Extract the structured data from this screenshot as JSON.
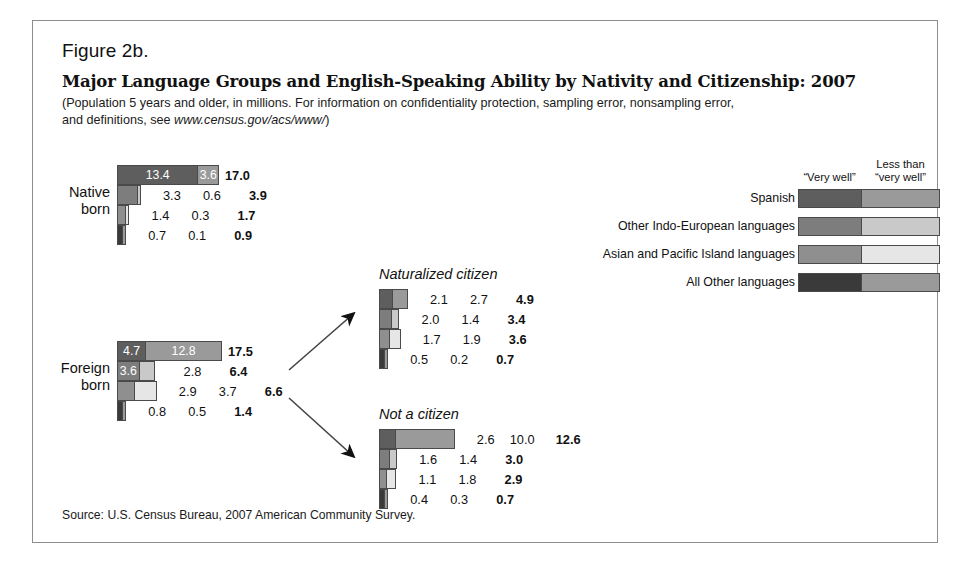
{
  "figure": {
    "number": "Figure 2b.",
    "title": "Major Language Groups and English-Speaking Ability by Nativity and Citizenship: 2007",
    "subtitle_line1": "(Population 5 years and older, in millions. For information on confidentiality protection, sampling error, nonsampling error,",
    "subtitle_line2_pre": "and definitions, see ",
    "subtitle_url": "www.census.gov/acs/www/",
    "subtitle_line2_post": ")",
    "source": "Source: U.S. Census Bureau, 2007 American Community Survey."
  },
  "legend": {
    "header_left": "“Very well”",
    "header_right_line1": "Less than",
    "header_right_line2": "“very well”",
    "items": [
      {
        "label": "Spanish",
        "color_very_well": "#5e5e5e",
        "color_less_than": "#9a9a9a"
      },
      {
        "label": "Other Indo-European languages",
        "color_very_well": "#7d7d7d",
        "color_less_than": "#c9c9c9"
      },
      {
        "label": "Asian and Pacific Island languages",
        "color_very_well": "#8f8f8f",
        "color_less_than": "#e6e6e6"
      },
      {
        "label": "All Other languages",
        "color_very_well": "#3a3a3a",
        "color_less_than": "#9a9a9a"
      }
    ]
  },
  "chart_data": {
    "type": "bar",
    "orientation": "horizontal-stacked",
    "title": "Major Language Groups and English-Speaking Ability by Nativity and Citizenship: 2007",
    "unit": "millions of people 5 years and older",
    "series": [
      {
        "name": "“Very well”",
        "color": "series-dark"
      },
      {
        "name": "Less than “very well”",
        "color": "series-light"
      }
    ],
    "categories": [
      "Spanish",
      "Other Indo-European languages",
      "Asian and Pacific Island languages",
      "All Other languages"
    ],
    "px_per_million": 6.0,
    "groups": [
      {
        "key": "native-born",
        "label_line1": "Native",
        "label_line2": "born",
        "title": "",
        "rows": [
          {
            "category": "Spanish",
            "very_well": "13.4",
            "less_than": "3.6",
            "total": "17.0",
            "very_well_v": 13.4,
            "less_than_v": 3.6,
            "total_v": 17.0,
            "inside": true
          },
          {
            "category": "Other Indo-European languages",
            "very_well": "3.3",
            "less_than": "0.6",
            "total": "3.9",
            "very_well_v": 3.3,
            "less_than_v": 0.6,
            "total_v": 3.9,
            "inside": false
          },
          {
            "category": "Asian and Pacific Island languages",
            "very_well": "1.4",
            "less_than": "0.3",
            "total": "1.7",
            "very_well_v": 1.4,
            "less_than_v": 0.3,
            "total_v": 1.7,
            "inside": false
          },
          {
            "category": "All Other languages",
            "very_well": "0.7",
            "less_than": "0.1",
            "total": "0.9",
            "very_well_v": 0.7,
            "less_than_v": 0.1,
            "total_v": 0.9,
            "inside": false
          }
        ]
      },
      {
        "key": "foreign-born",
        "label_line1": "Foreign",
        "label_line2": "born",
        "title": "",
        "rows": [
          {
            "category": "Spanish",
            "very_well": "4.7",
            "less_than": "12.8",
            "total": "17.5",
            "very_well_v": 4.7,
            "less_than_v": 12.8,
            "total_v": 17.5,
            "inside": true
          },
          {
            "category": "Other Indo-European languages",
            "very_well": "3.6",
            "less_than": "2.8",
            "total": "6.4",
            "very_well_v": 3.6,
            "less_than_v": 2.8,
            "total_v": 6.4,
            "inside": "first"
          },
          {
            "category": "Asian and Pacific Island languages",
            "very_well": "2.9",
            "less_than": "3.7",
            "total": "6.6",
            "very_well_v": 2.9,
            "less_than_v": 3.7,
            "total_v": 6.6,
            "inside": false
          },
          {
            "category": "All Other languages",
            "very_well": "0.8",
            "less_than": "0.5",
            "total": "1.4",
            "very_well_v": 0.8,
            "less_than_v": 0.5,
            "total_v": 1.4,
            "inside": false
          }
        ]
      },
      {
        "key": "naturalized-citizen",
        "label_line1": "",
        "label_line2": "",
        "title": "Naturalized citizen",
        "rows": [
          {
            "category": "Spanish",
            "very_well": "2.1",
            "less_than": "2.7",
            "total": "4.9",
            "very_well_v": 2.1,
            "less_than_v": 2.7,
            "total_v": 4.9,
            "inside": false
          },
          {
            "category": "Other Indo-European languages",
            "very_well": "2.0",
            "less_than": "1.4",
            "total": "3.4",
            "very_well_v": 2.0,
            "less_than_v": 1.4,
            "total_v": 3.4,
            "inside": false
          },
          {
            "category": "Asian and Pacific Island languages",
            "very_well": "1.7",
            "less_than": "1.9",
            "total": "3.6",
            "very_well_v": 1.7,
            "less_than_v": 1.9,
            "total_v": 3.6,
            "inside": false
          },
          {
            "category": "All Other languages",
            "very_well": "0.5",
            "less_than": "0.2",
            "total": "0.7",
            "very_well_v": 0.5,
            "less_than_v": 0.2,
            "total_v": 0.7,
            "inside": false
          }
        ]
      },
      {
        "key": "not-a-citizen",
        "label_line1": "",
        "label_line2": "",
        "title": "Not a citizen",
        "rows": [
          {
            "category": "Spanish",
            "very_well": "2.6",
            "less_than": "10.0",
            "total": "12.6",
            "very_well_v": 2.6,
            "less_than_v": 10.0,
            "total_v": 12.6,
            "inside": false
          },
          {
            "category": "Other Indo-European languages",
            "very_well": "1.6",
            "less_than": "1.4",
            "total": "3.0",
            "very_well_v": 1.6,
            "less_than_v": 1.4,
            "total_v": 3.0,
            "inside": false
          },
          {
            "category": "Asian and Pacific Island languages",
            "very_well": "1.1",
            "less_than": "1.8",
            "total": "2.9",
            "very_well_v": 1.1,
            "less_than_v": 1.8,
            "total_v": 2.9,
            "inside": false
          },
          {
            "category": "All Other languages",
            "very_well": "0.4",
            "less_than": "0.3",
            "total": "0.7",
            "very_well_v": 0.4,
            "less_than_v": 0.3,
            "total_v": 0.7,
            "inside": false
          }
        ]
      }
    ]
  },
  "layout": {
    "blocks": [
      {
        "key": "native-born",
        "left": 117,
        "top": 165,
        "label_left": 55,
        "label_top": 184,
        "title_left": 0,
        "title_top": 0
      },
      {
        "key": "foreign-born",
        "left": 117,
        "top": 341,
        "label_left": 55,
        "label_top": 360,
        "title_left": 0,
        "title_top": 0
      },
      {
        "key": "naturalized-citizen",
        "left": 379,
        "top": 289,
        "label_left": 0,
        "label_top": 0,
        "title_left": 379,
        "title_top": 266
      },
      {
        "key": "not-a-citizen",
        "left": 379,
        "top": 429,
        "label_left": 0,
        "label_top": 0,
        "title_left": 379,
        "title_top": 406
      }
    ]
  }
}
